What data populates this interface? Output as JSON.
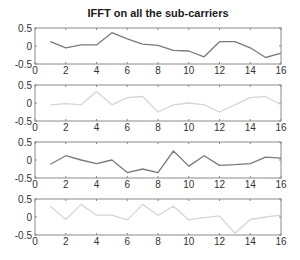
{
  "figure": {
    "title": "IFFT on all the sub-carriers"
  },
  "chart_data": [
    {
      "type": "line",
      "title": "IFFT on all the sub-carriers",
      "xlabel": "",
      "ylabel": "",
      "xlim": [
        0,
        16
      ],
      "ylim": [
        -0.5,
        0.5
      ],
      "xticks": [
        0,
        2,
        4,
        6,
        8,
        10,
        12,
        14,
        16
      ],
      "yticks": [
        -0.5,
        0,
        0.5
      ],
      "grid": false,
      "color": "#7a7a7a",
      "x": [
        1,
        2,
        3,
        4,
        5,
        6,
        7,
        8,
        9,
        10,
        11,
        12,
        13,
        14,
        15,
        16
      ],
      "values": [
        0.12,
        -0.05,
        0.03,
        0.03,
        0.37,
        0.2,
        0.05,
        0.02,
        -0.12,
        -0.14,
        -0.3,
        0.12,
        0.12,
        -0.05,
        -0.32,
        -0.2
      ]
    },
    {
      "type": "line",
      "title": "",
      "xlabel": "",
      "ylabel": "",
      "xlim": [
        0,
        16
      ],
      "ylim": [
        -0.5,
        0.5
      ],
      "xticks": [
        0,
        2,
        4,
        6,
        8,
        10,
        12,
        14,
        16
      ],
      "yticks": [
        -0.5,
        0,
        0.5
      ],
      "grid": false,
      "color": "#d6d6d6",
      "x": [
        1,
        2,
        3,
        4,
        5,
        6,
        7,
        8,
        9,
        10,
        11,
        12,
        13,
        14,
        15,
        16
      ],
      "values": [
        -0.05,
        -0.02,
        -0.05,
        0.32,
        -0.05,
        0.15,
        0.18,
        -0.25,
        -0.05,
        0.0,
        -0.05,
        -0.25,
        -0.05,
        0.15,
        0.18,
        -0.05
      ]
    },
    {
      "type": "line",
      "title": "",
      "xlabel": "",
      "ylabel": "",
      "xlim": [
        0,
        16
      ],
      "ylim": [
        -0.5,
        0.5
      ],
      "xticks": [
        0,
        2,
        4,
        6,
        8,
        10,
        12,
        14,
        16
      ],
      "yticks": [
        -0.5,
        0,
        0.5
      ],
      "grid": false,
      "color": "#7a7a7a",
      "x": [
        1,
        2,
        3,
        4,
        5,
        6,
        7,
        8,
        9,
        10,
        11,
        12,
        13,
        14,
        15,
        16
      ],
      "values": [
        -0.12,
        0.12,
        0.0,
        -0.1,
        0.0,
        -0.35,
        -0.25,
        -0.35,
        0.25,
        -0.17,
        0.12,
        -0.15,
        -0.13,
        -0.1,
        0.08,
        0.05
      ]
    },
    {
      "type": "line",
      "title": "",
      "xlabel": "",
      "ylabel": "",
      "xlim": [
        0,
        16
      ],
      "ylim": [
        -0.5,
        0.5
      ],
      "xticks": [
        0,
        2,
        4,
        6,
        8,
        10,
        12,
        14,
        16
      ],
      "yticks": [
        -0.5,
        0,
        0.5
      ],
      "grid": false,
      "color": "#d6d6d6",
      "x": [
        1,
        2,
        3,
        4,
        5,
        6,
        7,
        8,
        9,
        10,
        11,
        12,
        13,
        14,
        15,
        16
      ],
      "values": [
        0.3,
        -0.07,
        0.35,
        0.05,
        0.05,
        -0.08,
        0.35,
        0.05,
        0.3,
        -0.08,
        -0.02,
        0.03,
        -0.45,
        -0.07,
        0.0,
        0.05
      ]
    }
  ]
}
